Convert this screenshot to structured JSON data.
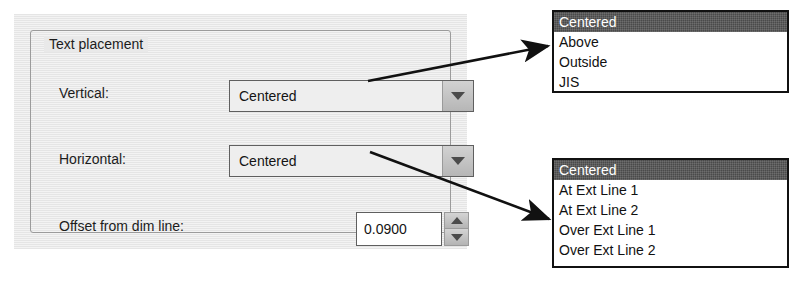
{
  "dialog": {
    "group_title": "Text placement",
    "fields": {
      "vertical": {
        "label": "Vertical:",
        "value": "Centered",
        "dropdown_icon": "chevron-down-icon"
      },
      "horizontal": {
        "label": "Horizontal:",
        "value": "Centered",
        "dropdown_icon": "chevron-down-icon"
      },
      "offset": {
        "label": "Offset from dim line:",
        "value": "0.0900",
        "increment_icon": "triangle-up-icon",
        "decrement_icon": "triangle-down-icon"
      }
    }
  },
  "dropdown_lists": {
    "vertical_options": {
      "items": [
        {
          "label": "Centered",
          "selected": true
        },
        {
          "label": "Above",
          "selected": false
        },
        {
          "label": "Outside",
          "selected": false
        },
        {
          "label": "JIS",
          "selected": false
        }
      ]
    },
    "horizontal_options": {
      "items": [
        {
          "label": "Centered",
          "selected": true
        },
        {
          "label": "At Ext Line 1",
          "selected": false
        },
        {
          "label": "At Ext Line 2",
          "selected": false
        },
        {
          "label": "Over Ext Line 1",
          "selected": false
        },
        {
          "label": "Over Ext Line 2",
          "selected": false
        }
      ]
    }
  },
  "colors": {
    "panel_background": "#e9e9e9",
    "groupbox_border": "#9b9b9b",
    "control_border": "#5f5f5f",
    "button_face": "#c2c2c2",
    "list_border": "#111111",
    "selection_background": "#4a4a4a",
    "selection_text": "#ffffff",
    "text": "#1c1c1c",
    "annotation_arrow": "#111111"
  }
}
